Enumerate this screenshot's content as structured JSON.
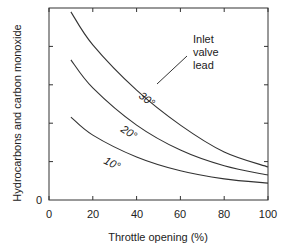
{
  "chart_data": {
    "type": "line",
    "title": "",
    "xlabel": "Throttle opening (%)",
    "ylabel": "Hydrocarbons and carbon monoxide",
    "xlim": [
      0,
      100
    ],
    "ylim": [
      0,
      5
    ],
    "x_ticks": [
      0,
      20,
      40,
      60,
      80,
      100
    ],
    "y_ticks": [
      0
    ],
    "y_tick_labels": [
      "0"
    ],
    "y_units": "arbitrary (unlabeled)",
    "grid": false,
    "x": [
      10,
      20,
      40,
      60,
      80,
      100
    ],
    "series": [
      {
        "name": "30°",
        "values": [
          4.9,
          4.04,
          2.86,
          1.95,
          1.25,
          0.86
        ]
      },
      {
        "name": "20°",
        "values": [
          3.65,
          2.92,
          1.95,
          1.3,
          0.89,
          0.65
        ]
      },
      {
        "name": "10°",
        "values": [
          2.16,
          1.69,
          1.12,
          0.76,
          0.55,
          0.44
        ]
      }
    ],
    "annotations": [
      {
        "text": "Inlet valve lead",
        "points_to": "30°"
      }
    ],
    "legend": "none (curves labeled inline)"
  },
  "labels": {
    "x_axis": "Throttle opening (%)",
    "y_axis": "Hydrocarbons and carbon monoxide",
    "y_zero": "0",
    "x_ticks": [
      "0",
      "20",
      "40",
      "60",
      "80",
      "100"
    ],
    "annotation_lines": [
      "Inlet",
      "valve",
      "lead"
    ],
    "curve_30": "30°",
    "curve_20": "20°",
    "curve_10": "10°"
  }
}
